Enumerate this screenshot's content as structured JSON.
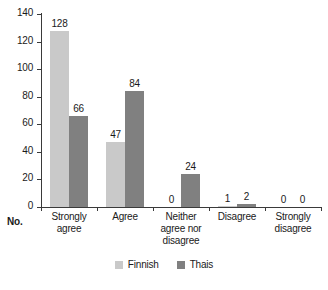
{
  "chart_data": {
    "type": "bar",
    "title": "",
    "xlabel": "",
    "ylabel": "No.",
    "categories": [
      "Strongly\nagree",
      "Agree",
      "Neither\nagree nor\ndisagree",
      "Disagree",
      "Strongly\ndisagree"
    ],
    "series": [
      {
        "name": "Finnish",
        "color": "#c9c9c9",
        "values": [
          128,
          47,
          0,
          1,
          0
        ]
      },
      {
        "name": "Thais",
        "color": "#808080",
        "values": [
          66,
          84,
          24,
          2,
          0
        ]
      }
    ],
    "ylim": [
      0,
      140
    ],
    "yticks": [
      0,
      20,
      40,
      60,
      80,
      100,
      120,
      140
    ],
    "ytick_labels": [
      "0",
      "20",
      "40",
      "60",
      "80",
      "100",
      "120",
      "140"
    ],
    "grid": false,
    "legend_position": "bottom",
    "data_labels": true
  },
  "axis": {
    "origin_label": "No."
  },
  "legend": {
    "items": [
      {
        "label": "Finnish",
        "swatch": "legend-swatch-finnish"
      },
      {
        "label": "Thais",
        "swatch": "legend-swatch-thais"
      }
    ]
  }
}
